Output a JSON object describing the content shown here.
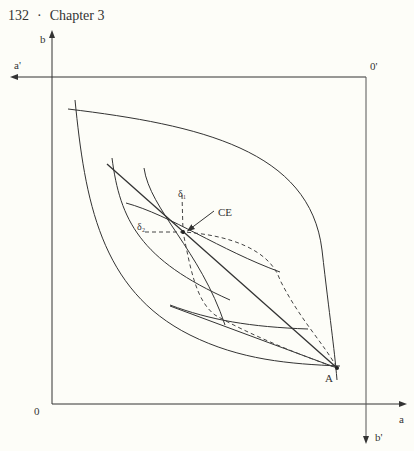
{
  "header": {
    "page_number": "132",
    "separator": "·",
    "chapter": "Chapter 3"
  },
  "diagram": {
    "type": "edgeworth-box",
    "axis_labels": {
      "origin_bottom_left": "0",
      "origin_top_right": "0'",
      "x_axis": "a",
      "y_axis": "b",
      "x_axis_prime": "a'",
      "y_axis_prime": "b'"
    },
    "point_labels": {
      "endowment": "A",
      "equilibrium": "CE"
    },
    "curve_labels": {
      "delta1": "δ₁",
      "delta2": "δ₂"
    },
    "colors": {
      "line": "#333333",
      "box": "#666666",
      "background": "#fdfdf8"
    }
  }
}
